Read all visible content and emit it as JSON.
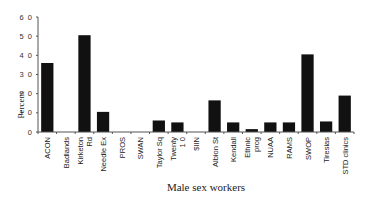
{
  "chart_data": {
    "type": "bar",
    "title": "",
    "xlabel": "Male sex workers",
    "ylabel": "Percent",
    "ylim": [
      0,
      60
    ],
    "yticks": [
      0,
      10,
      20,
      30,
      40,
      50,
      60
    ],
    "ytick_labels": [
      "0",
      "1 0",
      "2 0",
      "3 0",
      "4 0",
      "5 0",
      "6 0"
    ],
    "grid": false,
    "legend": null,
    "bar_color": "#111111",
    "categories": [
      [
        "ACON"
      ],
      [
        "Badlands"
      ],
      [
        "Kirketon",
        "Rd"
      ],
      [
        "Needle Ex"
      ],
      [
        "PROS"
      ],
      [
        "SWAN"
      ],
      [
        "Taylor Sq"
      ],
      [
        "Twenty",
        "1 0"
      ],
      [
        "$IIN"
      ],
      [
        "Albion St"
      ],
      [
        "Kendall"
      ],
      [
        "Ethnic",
        "prog"
      ],
      [
        "NUAA"
      ],
      [
        "RAMS"
      ],
      [
        "SWOP"
      ],
      [
        "Tiresias"
      ],
      [
        "STD clinics"
      ]
    ],
    "values": [
      36,
      0,
      50.5,
      10.5,
      0,
      0,
      6,
      5,
      0,
      16.5,
      5,
      1.5,
      5,
      5,
      40.5,
      5.5,
      19
    ]
  }
}
